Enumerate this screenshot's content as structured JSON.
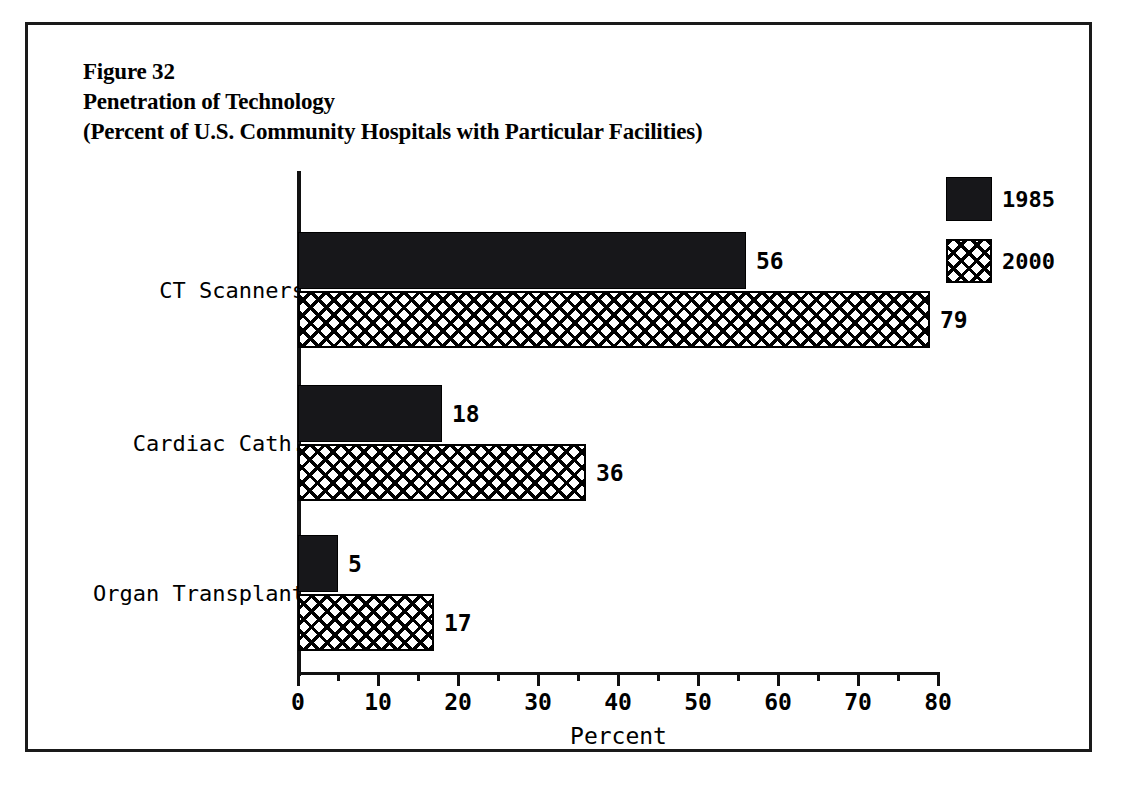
{
  "figure": {
    "title_lines": [
      "Figure 32",
      "Penetration of Technology",
      "(Percent of U.S. Community Hospitals with Particular Facilities)"
    ]
  },
  "chart_data": {
    "type": "bar",
    "orientation": "horizontal",
    "title": "Figure 32 Penetration of Technology (Percent of U.S. Community Hospitals with Particular Facilities)",
    "xlabel": "Percent",
    "ylabel": "",
    "xlim": [
      0,
      80
    ],
    "xticks": [
      0,
      10,
      20,
      30,
      40,
      50,
      60,
      70,
      80
    ],
    "xtick_labels": [
      "0",
      "10",
      "20",
      "30",
      "40",
      "50",
      "60",
      "70",
      "80"
    ],
    "minor_xticks": [
      5,
      15,
      25,
      35,
      45,
      55,
      65,
      75
    ],
    "grid": false,
    "legend_position": "top-right",
    "categories": [
      "CT Scanners",
      "Cardiac Cath.",
      "Organ Transplant"
    ],
    "series": [
      {
        "name": "1985",
        "values": [
          56,
          18,
          5
        ],
        "fill": "solid-black",
        "color": "#17171a"
      },
      {
        "name": "2000",
        "values": [
          79,
          36,
          17
        ],
        "fill": "crosshatch",
        "color": "#000000"
      }
    ]
  },
  "legend": {
    "entries": [
      {
        "label": "1985",
        "swatch": "solid"
      },
      {
        "label": "2000",
        "swatch": "hatch"
      }
    ]
  }
}
